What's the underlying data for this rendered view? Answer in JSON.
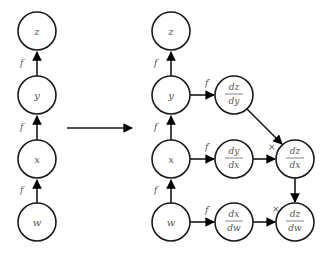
{
  "left_graph": {
    "nodes": [
      {
        "id": "z",
        "label": "z"
      },
      {
        "id": "y",
        "label": "y"
      },
      {
        "id": "x",
        "label": "x"
      },
      {
        "id": "w",
        "label": "w"
      }
    ],
    "edge_label": "f"
  },
  "transition_arrow": "→",
  "right_graph": {
    "forward_nodes": [
      {
        "id": "z",
        "label": "z"
      },
      {
        "id": "y",
        "label": "y"
      },
      {
        "id": "x",
        "label": "x"
      },
      {
        "id": "w",
        "label": "w"
      }
    ],
    "forward_edge_label": "f",
    "derivative_edge_label": "f′",
    "multiply_label": "×",
    "local_derivatives": [
      {
        "id": "dz_dy",
        "num": "dz",
        "den": "dy"
      },
      {
        "id": "dy_dx",
        "num": "dy",
        "den": "dx"
      },
      {
        "id": "dx_dw",
        "num": "dx",
        "den": "dw"
      }
    ],
    "chain_results": [
      {
        "id": "dz_dx",
        "num": "dz",
        "den": "dx"
      },
      {
        "id": "dz_dw",
        "num": "dz",
        "den": "dw"
      }
    ]
  }
}
